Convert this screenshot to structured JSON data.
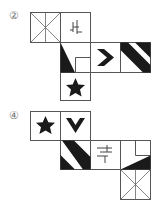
{
  "figures": [
    {
      "label": "②",
      "cells": [
        {
          "row": 0,
          "col": 0,
          "pattern": "x-cross-lines"
        },
        {
          "row": 0,
          "col": 1,
          "pattern": "glyph-character"
        },
        {
          "row": 1,
          "col": 1,
          "pattern": "triangle-with-corner-square"
        },
        {
          "row": 1,
          "col": 2,
          "pattern": "chevron-right"
        },
        {
          "row": 1,
          "col": 3,
          "pattern": "diagonal-stripes"
        },
        {
          "row": 2,
          "col": 1,
          "pattern": "star"
        }
      ]
    },
    {
      "label": "④",
      "cells": [
        {
          "row": 0,
          "col": 0,
          "pattern": "star"
        },
        {
          "row": 0,
          "col": 1,
          "pattern": "chevron-down"
        },
        {
          "row": 1,
          "col": 1,
          "pattern": "diagonal-stripes"
        },
        {
          "row": 1,
          "col": 2,
          "pattern": "glyph-character"
        },
        {
          "row": 1,
          "col": 3,
          "pattern": "triangle-with-corner-square"
        },
        {
          "row": 2,
          "col": 3,
          "pattern": "x-cross-lines"
        }
      ]
    }
  ],
  "colors": {
    "line": "#555555",
    "fill": "#1a1a1a",
    "label": "#777777"
  }
}
